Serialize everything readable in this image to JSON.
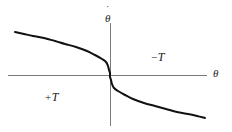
{
  "figure": {
    "background_color": "#ffffff",
    "axis_color": "#7a7a7a",
    "curve_color": "#111111"
  },
  "labels": {
    "y_axis_dot": "˙",
    "y_axis_symbol": "θ",
    "x_axis_symbol": "θ",
    "negative_torque_sign": "−",
    "negative_torque_symbol": "T",
    "positive_torque_sign": "+",
    "positive_torque_symbol": "T"
  },
  "chart_data": {
    "type": "line",
    "title": "",
    "subtitle": "",
    "xlabel": "θ",
    "ylabel": "θ̇",
    "grid": false,
    "legend": null,
    "xlim": [
      -1,
      1
    ],
    "ylim": [
      -1,
      1
    ],
    "axes": {
      "x_axis_y_value": 0,
      "y_axis_x_value": 0,
      "x_axis_pixel_y": 75,
      "y_axis_pixel_x": 110,
      "x_axis_pixel_start": 8,
      "x_axis_pixel_end": 207,
      "y_axis_pixel_start": 23,
      "y_axis_pixel_end": 126,
      "arrowheads": false,
      "ticks": []
    },
    "annotations": [
      {
        "text": "−T",
        "x": 0.42,
        "y": 0.46,
        "region": "upper-right"
      },
      {
        "text": "+T",
        "x": -0.65,
        "y": -0.33,
        "region": "lower-left"
      }
    ],
    "series": [
      {
        "name": "switching curve",
        "description": "monotonically decreasing odd curve through the origin with near-vertical slope at the origin; upper-left branch and lower-right branch",
        "x": [
          -0.96,
          -0.88,
          -0.8,
          -0.7,
          -0.6,
          -0.5,
          -0.4,
          -0.3,
          -0.22,
          -0.15,
          -0.1,
          -0.06,
          -0.03,
          -0.01,
          0.0,
          0.01,
          0.03,
          0.06,
          0.1,
          0.15,
          0.22,
          0.3,
          0.4,
          0.5,
          0.6,
          0.7,
          0.8,
          0.88,
          0.96
        ],
        "y": [
          0.83,
          0.81,
          0.78,
          0.75,
          0.71,
          0.67,
          0.62,
          0.56,
          0.5,
          0.43,
          0.36,
          0.28,
          0.18,
          0.08,
          0.0,
          -0.08,
          -0.18,
          -0.28,
          -0.36,
          -0.43,
          -0.5,
          -0.56,
          -0.62,
          -0.67,
          -0.71,
          -0.75,
          -0.78,
          -0.81,
          -0.83
        ],
        "pixel_points": [
          [
            15,
            32
          ],
          [
            24,
            34
          ],
          [
            33,
            36
          ],
          [
            44,
            38
          ],
          [
            55,
            41
          ],
          [
            65,
            44
          ],
          [
            76,
            47
          ],
          [
            87,
            51
          ],
          [
            95,
            55
          ],
          [
            102,
            59
          ],
          [
            106,
            62
          ],
          [
            108,
            66
          ],
          [
            109,
            70
          ],
          [
            110,
            73
          ],
          [
            110,
            75
          ],
          [
            110,
            77
          ],
          [
            111,
            80
          ],
          [
            112,
            84
          ],
          [
            114,
            88
          ],
          [
            118,
            91
          ],
          [
            125,
            95
          ],
          [
            133,
            99
          ],
          [
            144,
            103
          ],
          [
            155,
            106
          ],
          [
            166,
            109
          ],
          [
            177,
            112
          ],
          [
            188,
            114
          ],
          [
            197,
            116
          ],
          [
            205,
            118
          ]
        ]
      }
    ]
  }
}
